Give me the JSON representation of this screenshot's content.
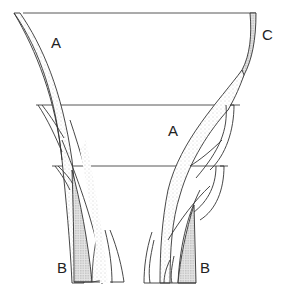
{
  "diagram": {
    "type": "line drawing",
    "labels": {
      "a_left": "A",
      "a_right": "A",
      "b_left": "B",
      "b_right": "B",
      "c": "C"
    },
    "colors": {
      "stroke": "#333333",
      "stipple_light": "#d8d8d8",
      "stipple_dark": "#bdbdbd",
      "background": "#ffffff"
    }
  }
}
